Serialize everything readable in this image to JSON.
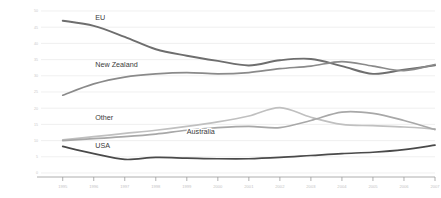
{
  "chart_data": {
    "type": "line",
    "title": "",
    "subtitle": "",
    "xlabel": "",
    "ylabel": "",
    "xlim": [
      1994.3,
      2007.0
    ],
    "ylim": [
      0,
      50
    ],
    "grid": true,
    "legend_position": "inline-labels",
    "x": [
      1995,
      1996,
      1997,
      1998,
      1999,
      2000,
      2001,
      2002,
      2003,
      2004,
      2005,
      2006,
      2007
    ],
    "xticklabels": [
      "1995",
      "1996",
      "1997",
      "1998",
      "1999",
      "2000",
      "2001",
      "2002",
      "2003",
      "2004",
      "2005",
      "2006",
      "2007"
    ],
    "yticks": [
      0,
      5,
      10,
      15,
      20,
      25,
      30,
      35,
      40,
      45,
      50
    ],
    "yticklabels": [
      "0",
      "5",
      "10",
      "15",
      "20",
      "25",
      "30",
      "35",
      "40",
      "45",
      "50"
    ],
    "series": [
      {
        "name": "EU",
        "color": "#6e6e6e",
        "width": 1.9,
        "label_x": 1996.05,
        "label_y": 47.2,
        "values": [
          47.0,
          45.4,
          42.0,
          38.2,
          36.2,
          34.6,
          33.2,
          34.8,
          35.2,
          33.0,
          30.6,
          31.9,
          33.2
        ]
      },
      {
        "name": "New Zealand",
        "color": "#8a8a8a",
        "width": 1.7,
        "label_x": 1996.05,
        "label_y": 32.6,
        "values": [
          24.0,
          27.5,
          29.6,
          30.6,
          31.0,
          30.6,
          31.0,
          32.2,
          33.0,
          34.4,
          33.0,
          31.6,
          33.5
        ]
      },
      {
        "name": "Other",
        "color": "#c0c0c0",
        "width": 1.7,
        "label_x": 1996.05,
        "label_y": 16.4,
        "values": [
          10.2,
          11.2,
          12.2,
          13.2,
          14.4,
          15.8,
          17.6,
          20.2,
          17.2,
          15.0,
          14.6,
          14.2,
          13.6
        ]
      },
      {
        "name": "Australia",
        "color": "#a8a8a8",
        "width": 1.7,
        "label_x": 1999.0,
        "label_y": 12.1,
        "values": [
          10.0,
          10.6,
          11.2,
          12.0,
          13.2,
          14.0,
          14.4,
          14.0,
          16.2,
          18.8,
          18.4,
          16.2,
          13.4
        ]
      },
      {
        "name": "USA",
        "color": "#4a4a4a",
        "width": 1.7,
        "label_x": 1996.05,
        "label_y": 7.8,
        "values": [
          8.2,
          6.0,
          4.2,
          4.8,
          4.6,
          4.4,
          4.4,
          4.8,
          5.4,
          6.0,
          6.4,
          7.2,
          8.6
        ]
      }
    ]
  }
}
